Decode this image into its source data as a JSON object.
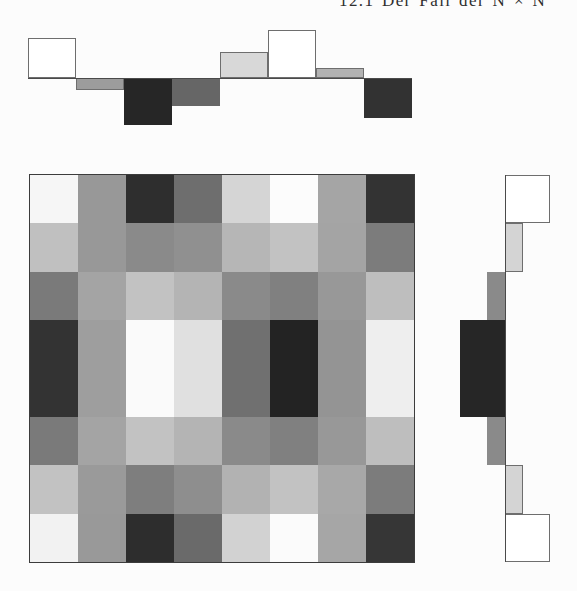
{
  "header": {
    "text": "12.1 Der Fall der N × N"
  },
  "chart_data": {
    "type": "heatmap",
    "title": "",
    "grid": {
      "rows": 8,
      "cols": 8,
      "cell_colors": [
        [
          "#f6f6f6",
          "#989898",
          "#2e2e2e",
          "#6e6e6e",
          "#d5d5d5",
          "#fcfcfc",
          "#a5a5a5",
          "#333333"
        ],
        [
          "#c0c0c0",
          "#989898",
          "#8a8a8a",
          "#909090",
          "#b6b6b6",
          "#c2c2c2",
          "#a4a4a4",
          "#7c7c7c"
        ],
        [
          "#7a7a7a",
          "#a4a4a4",
          "#c2c2c2",
          "#b4b4b4",
          "#8a8a8a",
          "#808080",
          "#989898",
          "#bebebe"
        ],
        [
          "#333333",
          "#9e9e9e",
          "#fafafa",
          "#e0e0e0",
          "#707070",
          "#232323",
          "#949494",
          "#eeeeee"
        ],
        [
          "#333333",
          "#9e9e9e",
          "#fafafa",
          "#e0e0e0",
          "#707070",
          "#232323",
          "#949494",
          "#eeeeee"
        ],
        [
          "#7a7a7a",
          "#a4a4a4",
          "#c2c2c2",
          "#b4b4b4",
          "#8a8a8a",
          "#808080",
          "#989898",
          "#bebebe"
        ],
        [
          "#c2c2c2",
          "#9a9a9a",
          "#7e7e7e",
          "#8e8e8e",
          "#b2b2b2",
          "#c2c2c2",
          "#a8a8a8",
          "#7c7c7c"
        ],
        [
          "#f2f2f2",
          "#999999",
          "#2d2d2d",
          "#6a6a6a",
          "#d2d2d2",
          "#fbfbfb",
          "#a6a6a6",
          "#363636"
        ]
      ]
    },
    "top_profile": {
      "orientation": "horizontal",
      "values": [
        40,
        -12,
        -47,
        -28,
        26,
        48,
        10,
        -40
      ],
      "colors": [
        "#ffffff",
        "#9c9c9c",
        "#262626",
        "#666666",
        "#d8d8d8",
        "#ffffff",
        "#b2b2b2",
        "#323232"
      ]
    },
    "right_profile": {
      "orientation": "vertical",
      "values": [
        45,
        18,
        -18,
        -45,
        -45,
        -18,
        18,
        45
      ],
      "colors": [
        "#ffffff",
        "#d4d4d4",
        "#8a8a8a",
        "#262626",
        "#262626",
        "#8a8a8a",
        "#d4d4d4",
        "#ffffff"
      ]
    }
  }
}
